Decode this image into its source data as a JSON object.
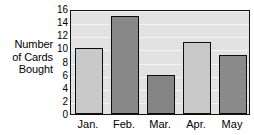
{
  "chart_data": {
    "type": "bar",
    "title": "",
    "xlabel": "",
    "ylabel": "Number of Cards Bought",
    "ylabel_lines": [
      "Number",
      "of Cards",
      "Bought"
    ],
    "categories": [
      "Jan.",
      "Feb.",
      "Mar.",
      "Apr.",
      "May"
    ],
    "values": [
      10,
      15,
      6,
      11,
      9
    ],
    "ylim": [
      0,
      16
    ],
    "ytick_labels": [
      "0",
      "2",
      "4",
      "6",
      "8",
      "10",
      "12",
      "14",
      "16"
    ],
    "ytick_values": [
      0,
      2,
      4,
      6,
      8,
      10,
      12,
      14,
      16
    ],
    "grid": true,
    "legend": "none",
    "bar_colors": [
      "#c9c9c9",
      "#888888",
      "#858585",
      "#c9c9c9",
      "#8a8a8a"
    ],
    "plot_background": "#e2e2e2",
    "gridline_color": "#f4f4f4",
    "axis_color": "#111111",
    "text_color": "#000000"
  }
}
